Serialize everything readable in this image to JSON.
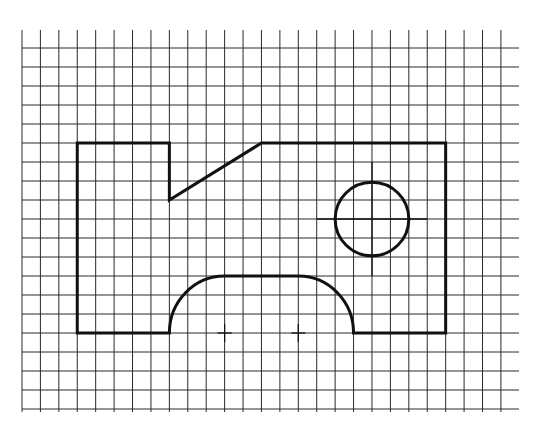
{
  "diagram": {
    "type": "technical-drawing-on-grid",
    "colors": {
      "background": "#ffffff",
      "grid": "#2a2a2a",
      "outline": "#111111"
    },
    "grid": {
      "origin_x": 22,
      "origin_y": 48,
      "cell_w": 18.42,
      "cell_h": 19.0,
      "cols": 26,
      "rows": 19,
      "vline_top": 30,
      "vline_bottom": 412,
      "hline_left": 22,
      "hline_right": 519
    },
    "outline_grid_units": {
      "description": "Plate outline in grid cells (col,row) from origin",
      "points": [
        [
          3,
          5
        ],
        [
          8,
          5
        ],
        [
          8,
          8
        ],
        [
          13,
          5
        ],
        [
          23,
          5
        ],
        [
          23,
          15
        ],
        [
          18,
          15
        ],
        [
          15,
          12
        ],
        [
          11,
          12
        ],
        [
          8,
          15
        ],
        [
          3,
          15
        ]
      ]
    },
    "features": {
      "hole": {
        "center_col": 19,
        "center_row": 9,
        "radius_cells": 2,
        "centerline_extent_cells": 3
      },
      "cutout_arc_centers": [
        {
          "col": 11,
          "row": 15
        },
        {
          "col": 15,
          "row": 15
        }
      ],
      "cutout_radius_cells": 3
    }
  }
}
